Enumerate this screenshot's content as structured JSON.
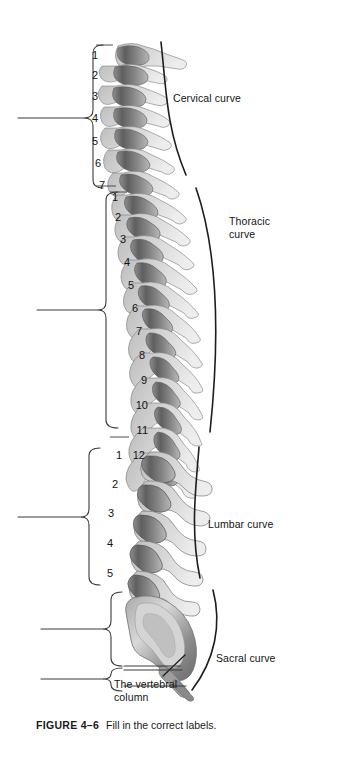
{
  "figure": {
    "caption_label": "FIGURE 4–6",
    "caption_text": "Fill in the correct labels.",
    "center_label": "The vertebral\ncolumn"
  },
  "regions": {
    "cervical": {
      "name": "cervical",
      "curve_label": "Cervical curve",
      "numbers": [
        "1",
        "2",
        "3",
        "4",
        "5",
        "6",
        "7"
      ]
    },
    "thoracic": {
      "name": "thoracic",
      "curve_label": "Thoracic\ncurve",
      "numbers": [
        "1",
        "2",
        "3",
        "4",
        "5",
        "6",
        "7",
        "8",
        "9",
        "10",
        "11",
        "12"
      ]
    },
    "lumbar": {
      "name": "lumbar",
      "curve_label": "Lumbar curve",
      "numbers": [
        "1",
        "2",
        "3",
        "4",
        "5"
      ]
    },
    "sacral": {
      "name": "sacral",
      "curve_label": "Sacral curve",
      "numbers": []
    }
  },
  "answer_lines": {
    "count": 5,
    "labels": [
      "cervical-answer-line",
      "thoracic-answer-line",
      "lumbar-answer-line",
      "sacrum-answer-line",
      "coccyx-answer-line"
    ]
  },
  "colors": {
    "ink": "#141414",
    "line": "#2b2b2b",
    "bone_dark": "#6e6e6e",
    "bone_mid": "#9a9a9a",
    "bone_light": "#c9c9c9",
    "background": "#ffffff"
  }
}
